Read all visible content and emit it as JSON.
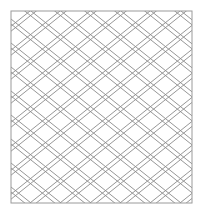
{
  "canvas": {
    "width": 204,
    "height": 215,
    "background_color": "#ffffff",
    "title": "Diamond Lattice Pattern"
  },
  "frame": {
    "name": "bounding-rectangle",
    "x": 11,
    "y": 11,
    "width": 181,
    "height": 192,
    "stroke_color": "#9a9a9a",
    "stroke_width": 1,
    "fill": "none"
  },
  "pattern": {
    "type": "diamond-lattice",
    "description": "Two overlaid rhombic (diamond) grids of straight lines, the second copy shifted slightly downward, producing paired double lines that cross at lens-shaped nodes.",
    "stroke_color": "#8a8a8a",
    "stroke_width": 0.9,
    "clip_to_frame": true,
    "lattice": {
      "half_period_x": 30,
      "half_period_y": 24,
      "slope_rise_over_run": 0.8,
      "origin_x": 16,
      "origin_y": 11
    },
    "layers": [
      {
        "name": "lattice-layer-primary",
        "offset_x": 0,
        "offset_y": 0,
        "opacity": 1
      },
      {
        "name": "lattice-layer-secondary",
        "offset_x": 0,
        "offset_y": 5,
        "opacity": 1
      }
    ],
    "line_counts": {
      "down_right_diagonals": 14,
      "down_left_diagonals": 14,
      "total_drawn_lines": 56
    },
    "top_peak_positions_x": [
      46,
      106,
      166
    ],
    "left_edge_node_positions_y": [
      35,
      59,
      83,
      107,
      131,
      155,
      179
    ]
  }
}
